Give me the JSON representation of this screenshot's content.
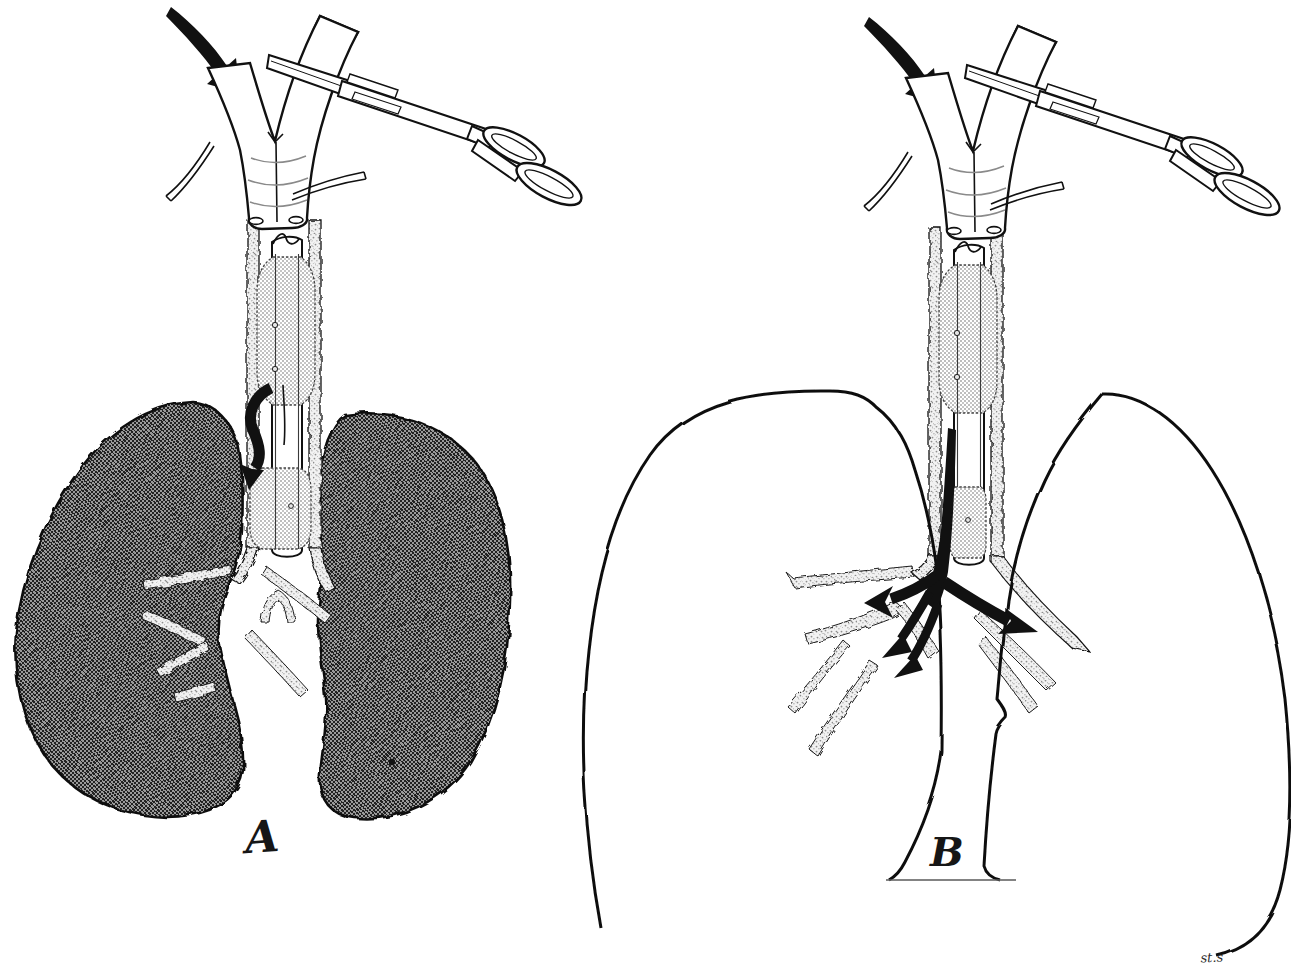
{
  "figure": {
    "kind": "medical-line-illustration",
    "background_color": "#ffffff",
    "ink_color": "#111111",
    "halftone_colors": {
      "lung_dark_checker": "#5c5c5c",
      "cuff_light_checker": "#dcdcdc",
      "tracheal_wall_stipple": "#f0f0f0"
    },
    "panels": [
      {
        "label": "A",
        "description": "Cuffed tube in trachea, Y-connector limb clamped, both lungs collapsed (dark halftone), airflow arrow curling downward inside trachea"
      },
      {
        "label": "B",
        "description": "Cuffed tube in trachea, Y-connector limb clamped, lungs expanded (outline only), black airflow arrows passing tube tip into both main bronchi"
      }
    ],
    "signature": "st.s",
    "elements": [
      "inflow-arrow",
      "y-connector",
      "hemostat-clamp",
      "pilot-tube",
      "tracheal-wall",
      "endotracheal-tube",
      "upper-cuff",
      "lower-cuff",
      "carina",
      "bronchus",
      "lung"
    ]
  }
}
